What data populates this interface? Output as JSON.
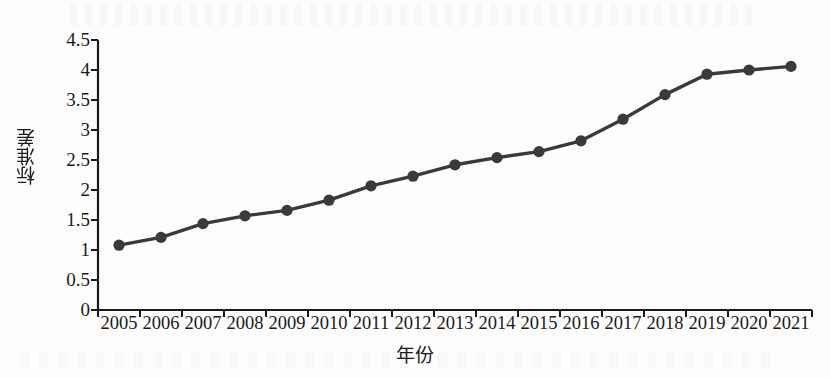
{
  "chart_data": {
    "type": "line",
    "title": "",
    "xlabel": "年份",
    "ylabel": "标准差",
    "categories": [
      "2005",
      "2006",
      "2007",
      "2008",
      "2009",
      "2010",
      "2011",
      "2012",
      "2013",
      "2014",
      "2015",
      "2016",
      "2017",
      "2018",
      "2019",
      "2020",
      "2021"
    ],
    "values": [
      1.08,
      1.21,
      1.44,
      1.57,
      1.66,
      1.83,
      2.07,
      2.23,
      2.42,
      2.54,
      2.64,
      2.82,
      3.18,
      3.59,
      3.93,
      4.0,
      4.06
    ],
    "series": [
      {
        "name": "标准差",
        "values": [
          1.08,
          1.21,
          1.44,
          1.57,
          1.66,
          1.83,
          2.07,
          2.23,
          2.42,
          2.54,
          2.64,
          2.82,
          3.18,
          3.59,
          3.93,
          4.0,
          4.06
        ]
      }
    ],
    "ylim": [
      0,
      4.5
    ],
    "ytick_labels": [
      "0",
      "0.5",
      "1",
      "1.5",
      "2",
      "2.5",
      "3",
      "3.5",
      "4",
      "4.5"
    ],
    "ytick_values": [
      0,
      0.5,
      1,
      1.5,
      2,
      2.5,
      3,
      3.5,
      4,
      4.5
    ],
    "grid": false,
    "legend": "none",
    "marker": "circle",
    "line_color": "#3a3a3a",
    "marker_color": "#3a3a3a",
    "axis_color": "#1a1a1a",
    "background_color": "#fdfdfd"
  }
}
